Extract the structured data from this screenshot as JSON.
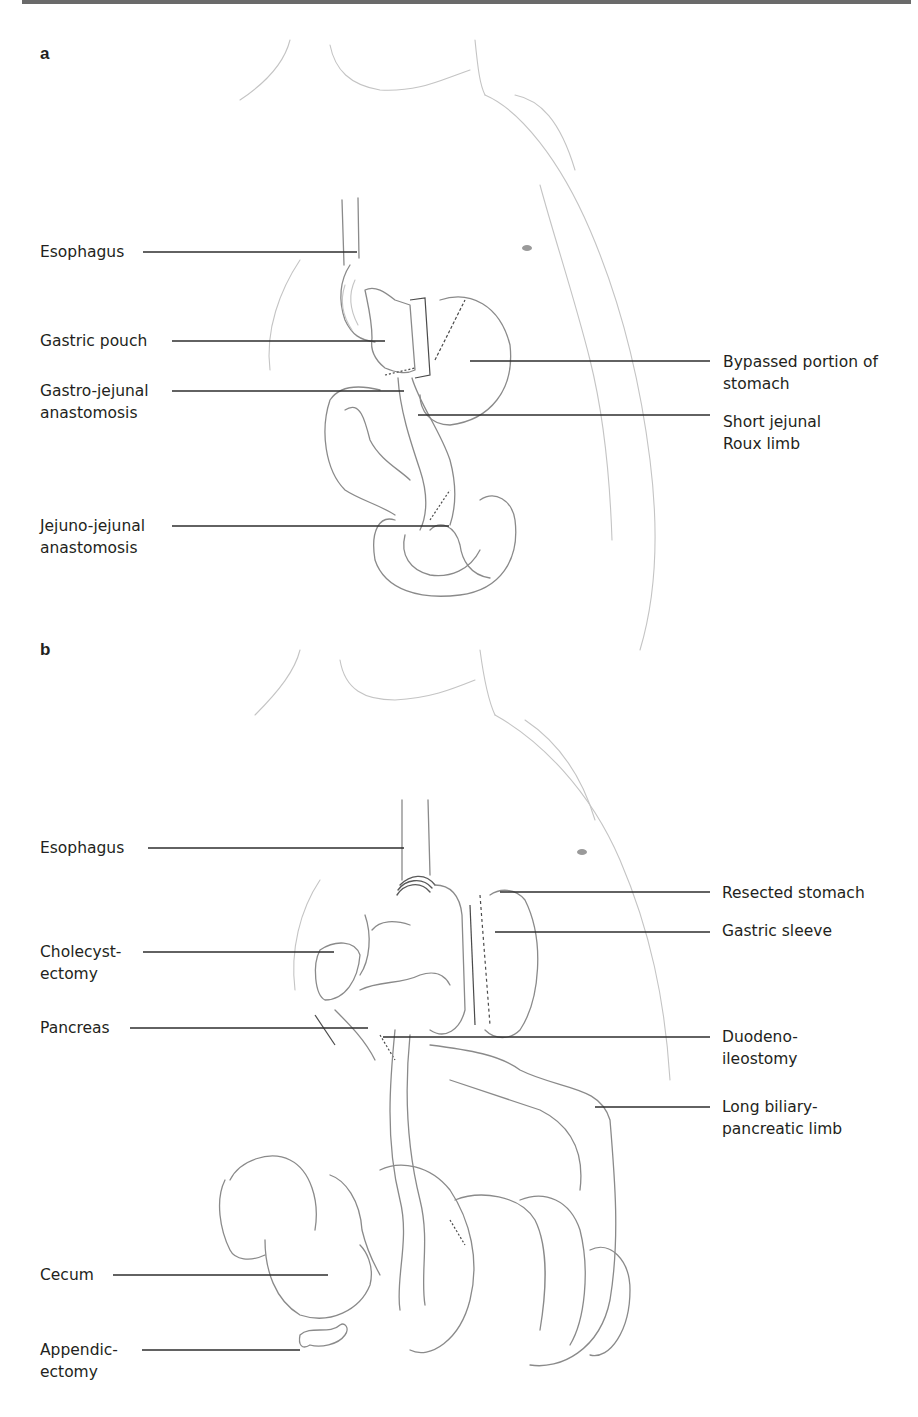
{
  "figure": {
    "panels": [
      {
        "letter": "a",
        "procedure_depicted": "Roux-en-Y gastric bypass",
        "left_labels": [
          {
            "text": "Esophagus"
          },
          {
            "text": "Gastric pouch"
          },
          {
            "text": "Gastro-jejunal\nanastomosis"
          },
          {
            "text": "Jejuno-jejunal\nanastomosis"
          }
        ],
        "right_labels": [
          {
            "text": "Bypassed portion of\nstomach"
          },
          {
            "text": "Short jejunal\nRoux limb"
          }
        ]
      },
      {
        "letter": "b",
        "procedure_depicted": "Biliopancreatic diversion with duodenal switch",
        "left_labels": [
          {
            "text": "Esophagus"
          },
          {
            "text": "Cholecyst-\nectomy"
          },
          {
            "text": "Pancreas"
          },
          {
            "text": "Cecum"
          },
          {
            "text": "Appendic-\nectomy"
          }
        ],
        "right_labels": [
          {
            "text": "Resected stomach"
          },
          {
            "text": "Gastric sleeve"
          },
          {
            "text": "Duodeno-\nileostomy"
          },
          {
            "text": "Long biliary-\npancreatic limb"
          }
        ]
      }
    ]
  }
}
